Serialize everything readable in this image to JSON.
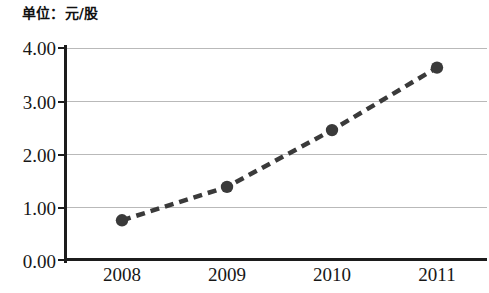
{
  "chart_data": {
    "type": "line",
    "title": "单位：元/股",
    "xlabel": "",
    "ylabel": "",
    "categories": [
      "2008",
      "2009",
      "2010",
      "2011"
    ],
    "series": [
      {
        "name": "每股收益",
        "values": [
          0.75,
          1.38,
          2.45,
          3.63
        ]
      }
    ],
    "ylim": [
      0.0,
      4.0
    ],
    "ytick_labels": [
      "0.00",
      "1.00",
      "2.00",
      "3.00",
      "4.00"
    ],
    "ytick_values": [
      0.0,
      1.0,
      2.0,
      3.0,
      4.0
    ],
    "xtick_labels": [
      "2008",
      "2009",
      "2010",
      "2011"
    ],
    "grid": "horizontal",
    "legend": "none",
    "line_style": "dashed",
    "marker": "circle",
    "colors": {
      "line": "#3a3a3a",
      "marker": "#3a3a3a",
      "gridline": "#b9b9b9",
      "axis": "#1c1c1c",
      "text": "#171717",
      "background": "#ffffff"
    }
  },
  "title_text": "单位：元/股"
}
